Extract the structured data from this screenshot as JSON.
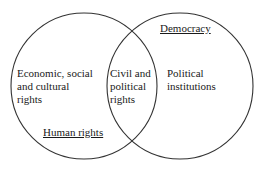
{
  "diagram": {
    "type": "venn",
    "sets": [
      {
        "id": "human_rights",
        "title": "Human rights",
        "center": [
          84,
          86
        ],
        "radius": 73
      },
      {
        "id": "democracy",
        "title": "Democracy",
        "center": [
          180,
          86
        ],
        "radius": 73
      }
    ],
    "regions": {
      "left_only": [
        "Economic, social",
        "and cultural",
        "rights"
      ],
      "overlap": [
        "Civil and",
        "political",
        "rights"
      ],
      "right_only": [
        "Political",
        "institutions"
      ]
    },
    "stroke_color": "#333333"
  }
}
